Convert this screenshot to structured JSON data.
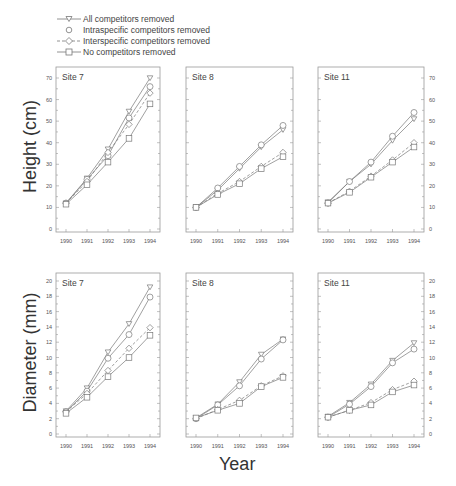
{
  "chart_data": [
    {
      "type": "line",
      "title": "Site 7",
      "ylabel": "Height (cm)",
      "xlabel": "Year",
      "x": [
        1990,
        1991,
        1992,
        1993,
        1994
      ],
      "ylim": [
        0,
        70
      ],
      "yticks": [
        0,
        10,
        20,
        30,
        40,
        50,
        60,
        70
      ],
      "series": [
        {
          "name": "All competitors removed",
          "values": [
            12,
            23.5,
            37,
            54.5,
            70
          ]
        },
        {
          "name": "Intraspecific competitors removed",
          "values": [
            12,
            23,
            34,
            51.5,
            66
          ]
        },
        {
          "name": "Interspecific competitors removed",
          "values": [
            12,
            22,
            35.5,
            48.5,
            63
          ]
        },
        {
          "name": "No competitors removed",
          "values": [
            11.5,
            20.5,
            31,
            42,
            58
          ]
        }
      ]
    },
    {
      "type": "line",
      "title": "Site 8",
      "ylabel": "Height (cm)",
      "xlabel": "Year",
      "x": [
        1990,
        1991,
        1992,
        1993,
        1994
      ],
      "ylim": [
        0,
        70
      ],
      "series": [
        {
          "name": "All competitors removed",
          "values": [
            10,
            18,
            28,
            38,
            46
          ]
        },
        {
          "name": "Intraspecific competitors removed",
          "values": [
            10,
            19,
            29,
            39,
            48
          ]
        },
        {
          "name": "Interspecific competitors removed",
          "values": [
            10,
            16.5,
            22,
            29,
            35.5
          ]
        },
        {
          "name": "No competitors removed",
          "values": [
            10,
            16,
            21,
            28,
            33.5
          ]
        }
      ]
    },
    {
      "type": "line",
      "title": "Site 11",
      "ylabel": "Height (cm)",
      "xlabel": "Year",
      "x": [
        1990,
        1991,
        1992,
        1993,
        1994
      ],
      "ylim": [
        0,
        70
      ],
      "yticks": [
        0,
        10,
        20,
        30,
        40,
        50,
        60,
        70
      ],
      "series": [
        {
          "name": "All competitors removed",
          "values": [
            12.5,
            22,
            30,
            41,
            51
          ]
        },
        {
          "name": "Intraspecific competitors removed",
          "values": [
            12,
            22,
            31,
            43,
            54
          ]
        },
        {
          "name": "Interspecific competitors removed",
          "values": [
            12,
            17.5,
            24.5,
            32,
            40
          ]
        },
        {
          "name": "No competitors removed",
          "values": [
            12,
            17,
            24,
            31,
            38
          ]
        }
      ]
    },
    {
      "type": "line",
      "title": "Site 7",
      "ylabel": "Diameter (mm)",
      "xlabel": "Year",
      "x": [
        1990,
        1991,
        1992,
        1993,
        1994
      ],
      "ylim": [
        0,
        20
      ],
      "yticks": [
        0,
        2,
        4,
        6,
        8,
        10,
        12,
        14,
        16,
        18,
        20
      ],
      "series": [
        {
          "name": "All competitors removed",
          "values": [
            3,
            6,
            10.7,
            14.4,
            19.2
          ]
        },
        {
          "name": "Intraspecific competitors removed",
          "values": [
            2.9,
            5.6,
            9.9,
            13,
            17.9
          ]
        },
        {
          "name": "Interspecific competitors removed",
          "values": [
            2.9,
            5.3,
            8.3,
            11.2,
            13.9
          ]
        },
        {
          "name": "No competitors removed",
          "values": [
            2.7,
            4.8,
            7.5,
            10,
            12.9
          ]
        }
      ]
    },
    {
      "type": "line",
      "title": "Site 8",
      "ylabel": "Diameter (mm)",
      "xlabel": "Year",
      "x": [
        1990,
        1991,
        1992,
        1993,
        1994
      ],
      "ylim": [
        0,
        20
      ],
      "series": [
        {
          "name": "All competitors removed",
          "values": [
            2.1,
            3.9,
            6.8,
            10.4,
            12.4
          ]
        },
        {
          "name": "Intraspecific competitors removed",
          "values": [
            2,
            3.8,
            6.3,
            9.8,
            12.3
          ]
        },
        {
          "name": "Interspecific competitors removed",
          "values": [
            2,
            3.2,
            4.4,
            6.3,
            7.6
          ]
        },
        {
          "name": "No competitors removed",
          "values": [
            2.1,
            3.1,
            4,
            6.2,
            7.4
          ]
        }
      ]
    },
    {
      "type": "line",
      "title": "Site 11",
      "ylabel": "Diameter (mm)",
      "xlabel": "Year",
      "x": [
        1990,
        1991,
        1992,
        1993,
        1994
      ],
      "ylim": [
        0,
        20
      ],
      "yticks": [
        0,
        2,
        4,
        6,
        8,
        10,
        12,
        14,
        16,
        18,
        20
      ],
      "series": [
        {
          "name": "All competitors removed",
          "values": [
            2.3,
            4.1,
            6.5,
            9.6,
            11.9
          ]
        },
        {
          "name": "Intraspecific competitors removed",
          "values": [
            2.2,
            3.9,
            6.2,
            9.3,
            11.1
          ]
        },
        {
          "name": "Interspecific competitors removed",
          "values": [
            2.2,
            3.1,
            4.1,
            5.8,
            6.9
          ]
        },
        {
          "name": "No competitors removed",
          "values": [
            2.2,
            3.1,
            3.8,
            5.5,
            6.4
          ]
        }
      ]
    }
  ],
  "legend": [
    {
      "label": "All competitors removed",
      "marker": "triangle-down",
      "line": "solid"
    },
    {
      "label": "Intraspecific competitors removed",
      "marker": "circle",
      "line": "none"
    },
    {
      "label": "Interspecific competitors removed",
      "marker": "diamond",
      "line": "dashed"
    },
    {
      "label": "No competitors removed",
      "marker": "square",
      "line": "solid"
    }
  ],
  "labels": {
    "height_axis": "Height (cm)",
    "diameter_axis": "Diameter (mm)",
    "year_axis": "Year"
  },
  "x_tick_labels": [
    "1990",
    "1991",
    "1992",
    "1993",
    "1994"
  ]
}
